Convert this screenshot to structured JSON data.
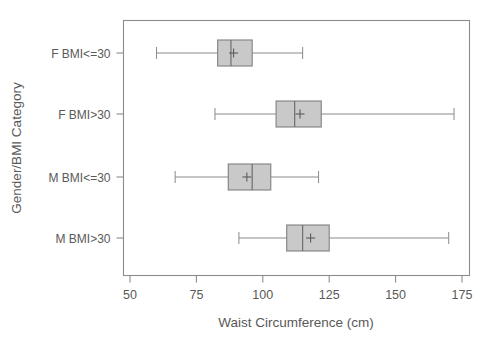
{
  "chart_data": {
    "type": "box",
    "title": "",
    "xlabel": "Waist Circumference (cm)",
    "ylabel": "Gender/BMI Category",
    "xlim": [
      50,
      175
    ],
    "xticks": [
      50,
      75,
      100,
      125,
      150,
      175
    ],
    "xtick_labels": [
      "50",
      "75",
      "100",
      "125",
      "150",
      "175"
    ],
    "categories": [
      "F BMI<=30",
      "F BMI>30",
      "M BMI<=30",
      "M BMI>30"
    ],
    "grid": false,
    "legend": "none",
    "orientation": "horizontal",
    "boxes": [
      {
        "category": "F BMI<=30",
        "whisker_low": 60,
        "q1": 83,
        "median": 88,
        "mean": 89,
        "q3": 96,
        "whisker_high": 115
      },
      {
        "category": "F BMI>30",
        "whisker_low": 82,
        "q1": 105,
        "median": 112,
        "mean": 114,
        "q3": 122,
        "whisker_high": 172
      },
      {
        "category": "M BMI<=30",
        "whisker_low": 67,
        "q1": 87,
        "median": 96,
        "mean": 94,
        "q3": 103,
        "whisker_high": 121
      },
      {
        "category": "M BMI>30",
        "whisker_low": 91,
        "q1": 109,
        "median": 115,
        "mean": 118,
        "q3": 125,
        "whisker_high": 170
      }
    ],
    "colors": {
      "box_fill": "#c9c9c9",
      "box_border": "#808080",
      "whisker": "#8a8a8a",
      "median": "#6e6e6e",
      "axis": "#8c8c8c",
      "text": "#595959",
      "background": "#ffffff"
    }
  }
}
